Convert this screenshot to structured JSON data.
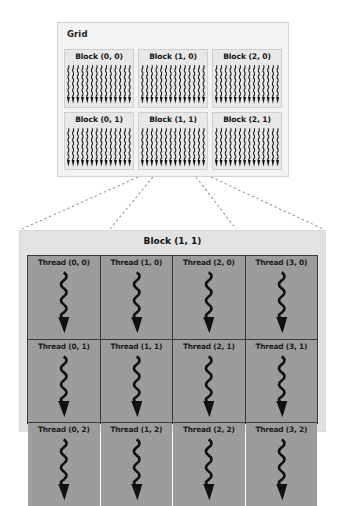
{
  "diagram": {
    "colors": {
      "page_background": "#ffffff",
      "grid_panel_background": "#f3f3f3",
      "grid_panel_border": "#d2d2d2",
      "block_cell_background": "#e8e8e8",
      "block_cell_border": "#cfcfcf",
      "detail_panel_background": "#e2e2e2",
      "thread_cell_background": "#9c9c9c",
      "thread_cell_border": "#3a3a3a",
      "connector_line": "#9a9a9a",
      "text": "#141414"
    }
  },
  "grid": {
    "label": "Grid",
    "rows": [
      {
        "blocks": [
          {
            "label": "Block (0, 0)",
            "icon": "thread-bundle-icon"
          },
          {
            "label": "Block (1, 0)",
            "icon": "thread-bundle-icon"
          },
          {
            "label": "Block (2, 0)",
            "icon": "thread-bundle-icon"
          }
        ]
      },
      {
        "blocks": [
          {
            "label": "Block (0, 1)",
            "icon": "thread-bundle-icon"
          },
          {
            "label": "Block (1, 1)",
            "icon": "thread-bundle-icon"
          },
          {
            "label": "Block (2, 1)",
            "icon": "thread-bundle-icon"
          }
        ]
      }
    ]
  },
  "detail": {
    "title": "Block (1, 1)",
    "expanded_from": "Block (1, 1)",
    "rows": [
      {
        "threads": [
          {
            "label": "Thread (0, 0)",
            "icon": "wavy-arrow-icon"
          },
          {
            "label": "Thread (1, 0)",
            "icon": "wavy-arrow-icon"
          },
          {
            "label": "Thread (2, 0)",
            "icon": "wavy-arrow-icon"
          },
          {
            "label": "Thread (3, 0)",
            "icon": "wavy-arrow-icon"
          }
        ]
      },
      {
        "threads": [
          {
            "label": "Thread (0, 1)",
            "icon": "wavy-arrow-icon"
          },
          {
            "label": "Thread (1, 1)",
            "icon": "wavy-arrow-icon"
          },
          {
            "label": "Thread (2, 1)",
            "icon": "wavy-arrow-icon"
          },
          {
            "label": "Thread (3, 1)",
            "icon": "wavy-arrow-icon"
          }
        ]
      },
      {
        "threads": [
          {
            "label": "Thread (0, 2)",
            "icon": "wavy-arrow-icon"
          },
          {
            "label": "Thread (1, 2)",
            "icon": "wavy-arrow-icon"
          },
          {
            "label": "Thread (2, 2)",
            "icon": "wavy-arrow-icon"
          },
          {
            "label": "Thread (3, 2)",
            "icon": "wavy-arrow-icon"
          }
        ]
      }
    ]
  },
  "connectors": [
    {
      "name": "connector-left-outer",
      "x1": 138,
      "y1": 177,
      "x2": 22,
      "y2": 229
    },
    {
      "name": "connector-left-inner",
      "x1": 153,
      "y1": 177,
      "x2": 110,
      "y2": 229
    },
    {
      "name": "connector-right-inner",
      "x1": 196,
      "y1": 177,
      "x2": 236,
      "y2": 229
    },
    {
      "name": "connector-right-outer",
      "x1": 211,
      "y1": 177,
      "x2": 323,
      "y2": 229
    }
  ]
}
